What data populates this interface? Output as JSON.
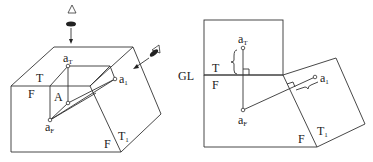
{
  "left_figure": {
    "labels": {
      "aT": "a",
      "aT_sub": "T",
      "a1": "a",
      "a1_sub": "1",
      "aF": "a",
      "aF_sub": "F",
      "A": "A",
      "T": "T",
      "F": "F",
      "F2": "F",
      "T1": "T",
      "T1_sub": "1"
    },
    "icons": [
      "eye-top-view-icon",
      "eye-auxiliary-view-icon"
    ]
  },
  "right_figure": {
    "labels": {
      "GL": "GL",
      "T": "T",
      "F": "F",
      "aT": "a",
      "aT_sub": "T",
      "aF": "a",
      "aF_sub": "F",
      "a1": "a",
      "a1_sub": "1",
      "F2": "F",
      "T1": "T",
      "T1_sub": "1"
    }
  },
  "colors": {
    "line": "#333333",
    "background": "#ffffff"
  }
}
